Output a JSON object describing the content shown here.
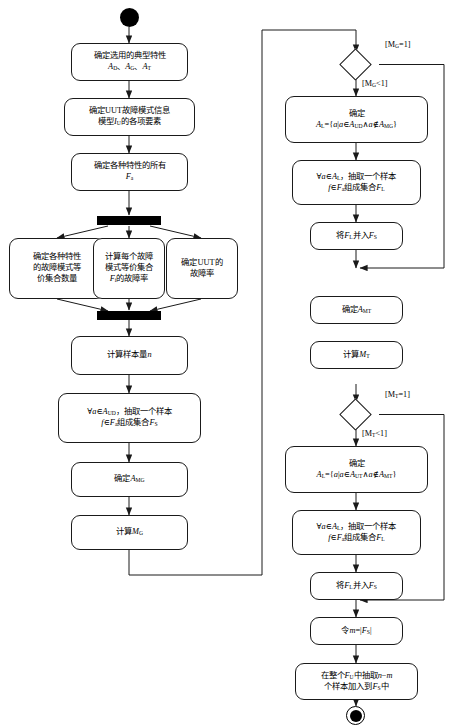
{
  "diagram": {
    "type": "uml-activity-flowchart",
    "stroke_color": "#1a1a1a",
    "fill_color": "#ffffff"
  },
  "nodes": {
    "start": {
      "kind": "initial-node",
      "label": ""
    },
    "n1": {
      "line1": "确定选用的典型特性",
      "line2_a": "A",
      "line2_a_sub": "D",
      "line2_b": "A",
      "line2_b_sub": "G",
      "line2_c": "A",
      "line2_c_sub": "T",
      "sep": "、"
    },
    "n2": {
      "line1": "确定UUT故障模式信息",
      "line2_pre": "模型",
      "line2_var": "I",
      "line2_sub": "U",
      "line2_post": "的各项要素"
    },
    "n3": {
      "line1": "确定各种特性的所有",
      "line2_var": "F",
      "line2_sub": "a"
    },
    "fork": {
      "kind": "fork-bar",
      "label": ""
    },
    "p1": {
      "line1": "确定各种特性",
      "line2": "的故障模式等",
      "line3": "价集合数量"
    },
    "p2": {
      "line1": "计算每个故障",
      "line2": "模式等价集合",
      "line3_var": "F",
      "line3_sub": "i",
      "line3_post": "的故障率"
    },
    "p3": {
      "line1": "确定UUT的",
      "line2": "故障率"
    },
    "join": {
      "kind": "join-bar",
      "label": ""
    },
    "n4": {
      "pre": "计算样本量",
      "var": "n"
    },
    "n5": {
      "line1_pre": "∀",
      "line1_var": "a",
      "line1_in": "∈",
      "line1_set": "A",
      "line1_set_sub": "UD",
      "line1_post": "，抽取一个样本",
      "line2_f": "f",
      "line2_in": "∈",
      "line2_F": "F",
      "line2_F_sub": "a",
      "line2_mid": "组成集合",
      "line2_G": "F",
      "line2_G_sub": "S"
    },
    "n6": {
      "pre": "确定",
      "var": "A",
      "sub": "MG"
    },
    "n7": {
      "pre": "计算",
      "var": "M",
      "sub": "G"
    },
    "d1": {
      "kind": "decision",
      "label": ""
    },
    "d1_yes": {
      "text": "[M",
      "sub": "G",
      "tail": "=1]"
    },
    "d1_no": {
      "text": "[M",
      "sub": "G",
      "tail": "<1]"
    },
    "r1": {
      "line1": "确定",
      "line2_A": "A",
      "line2_A_sub": "L",
      "line2_eq": "={",
      "line2_a1": "a",
      "line2_bar": "|",
      "line2_a2": "a",
      "line2_in": "∈",
      "line2_S1": "A",
      "line2_S1_sub": "UD",
      "line2_and": "∧",
      "line2_a3": "a",
      "line2_nin": "∉",
      "line2_S2": "A",
      "line2_S2_sub": "MG",
      "line2_close": "}"
    },
    "r2": {
      "line1_pre": "∀",
      "line1_var": "a",
      "line1_in": "∈",
      "line1_set": "A",
      "line1_set_sub": "L",
      "line1_post": "，抽取一个样本",
      "line2_f": "f",
      "line2_in": "∈",
      "line2_F": "F",
      "line2_F_sub": "a",
      "line2_mid": "组成集合",
      "line2_G": "F",
      "line2_G_sub": "L"
    },
    "r3": {
      "pre": "将",
      "v1": "F",
      "v1_sub": "L",
      "mid": "并入",
      "v2": "F",
      "v2_sub": "S"
    },
    "r4": {
      "pre": "确定",
      "var": "A",
      "sub": "MT"
    },
    "r5": {
      "pre": "计算",
      "var": "M",
      "sub": "T"
    },
    "d2": {
      "kind": "decision",
      "label": ""
    },
    "d2_yes": {
      "text": "[M",
      "sub": "T",
      "tail": "=1]"
    },
    "d2_no": {
      "text": "[M",
      "sub": "T",
      "tail": "<1]"
    },
    "r6": {
      "line1": "确定",
      "line2_A": "A",
      "line2_A_sub": "L",
      "line2_eq": "={",
      "line2_a1": "a",
      "line2_bar": "|",
      "line2_a2": "a",
      "line2_in": "∈",
      "line2_S1": "A",
      "line2_S1_sub": "UT",
      "line2_and": "∧",
      "line2_a3": "a",
      "line2_nin": "∉",
      "line2_S2": "A",
      "line2_S2_sub": "MT",
      "line2_close": "}"
    },
    "r7": {
      "line1_pre": "∀",
      "line1_var": "a",
      "line1_in": "∈",
      "line1_set": "A",
      "line1_set_sub": "L",
      "line1_post": "，抽取一个样本",
      "line2_f": "f",
      "line2_in": "∈",
      "line2_F": "F",
      "line2_F_sub": "a",
      "line2_mid": "组成集合",
      "line2_G": "F",
      "line2_G_sub": "L"
    },
    "r8": {
      "pre": "将",
      "v1": "F",
      "v1_sub": "L",
      "mid": "并入",
      "v2": "F",
      "v2_sub": "S"
    },
    "r9": {
      "pre": "令",
      "m": "m",
      "eq": "=|",
      "F": "F",
      "F_sub": "S",
      "close": "|"
    },
    "r10": {
      "line1_pre": "在整个",
      "line1_F": "F",
      "line1_F_sub": "U",
      "line1_mid": "中抽取",
      "line1_n": "n",
      "line1_minus": "−",
      "line1_m": "m",
      "line2_pre": "个样本加入到",
      "line2_F": "F",
      "line2_F_sub": "S",
      "line2_post": "中"
    },
    "end": {
      "kind": "final-node",
      "label": ""
    }
  }
}
